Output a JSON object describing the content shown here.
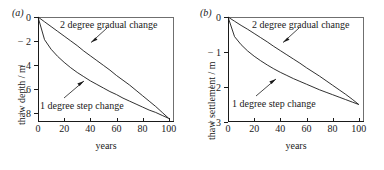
{
  "figure": {
    "panels": [
      {
        "label": "(a)",
        "xlabel": "years",
        "ylabel": "thaw depth / m",
        "xticks": [
          "0",
          "20",
          "40",
          "60",
          "80",
          "100"
        ],
        "yticks": [
          "0",
          "− 2",
          "− 4",
          "− 6",
          "− 8"
        ],
        "anno_gradual": "2 degree gradual change",
        "anno_step": "1 degree step change"
      },
      {
        "label": "(b)",
        "xlabel": "years",
        "ylabel": "thaw settlement / m",
        "xticks": [
          "0",
          "20",
          "40",
          "60",
          "80",
          "100"
        ],
        "yticks": [
          "0",
          "− 1",
          "− 2",
          "− 3"
        ],
        "anno_gradual": "2 degree gradual change",
        "anno_step": "1 degree step change"
      }
    ],
    "line_color": "#1a1a1a"
  },
  "chart_data": [
    {
      "type": "line",
      "title": "(a)",
      "xlabel": "years",
      "ylabel": "thaw depth / m",
      "xlim": [
        0,
        104
      ],
      "ylim": [
        -8.8,
        0
      ],
      "xticks": [
        0,
        20,
        40,
        60,
        80,
        100
      ],
      "yticks": [
        0,
        -2,
        -4,
        -6,
        -8
      ],
      "grid": false,
      "legend": "annotations-with-arrows",
      "x": [
        0,
        5,
        10,
        15,
        20,
        25,
        30,
        35,
        40,
        45,
        50,
        55,
        60,
        65,
        70,
        75,
        80,
        85,
        90,
        95,
        100
      ],
      "series": [
        {
          "name": "1 degree step change",
          "values": [
            0,
            -1.9,
            -2.7,
            -3.3,
            -3.8,
            -4.25,
            -4.65,
            -5.0,
            -5.35,
            -5.65,
            -5.95,
            -6.25,
            -6.5,
            -6.8,
            -7.05,
            -7.3,
            -7.55,
            -7.8,
            -8.0,
            -8.25,
            -8.5
          ]
        },
        {
          "name": "2 degree gradual change",
          "values": [
            0,
            -0.4,
            -0.8,
            -1.2,
            -1.6,
            -2.0,
            -2.4,
            -2.85,
            -3.25,
            -3.65,
            -4.05,
            -4.45,
            -4.9,
            -5.3,
            -5.7,
            -6.15,
            -6.6,
            -7.05,
            -7.5,
            -8.0,
            -8.5
          ]
        }
      ]
    },
    {
      "type": "line",
      "title": "(b)",
      "xlabel": "years",
      "ylabel": "thaw settlement / m",
      "xlim": [
        0,
        104
      ],
      "ylim": [
        -3,
        0
      ],
      "xticks": [
        0,
        20,
        40,
        60,
        80,
        100
      ],
      "yticks": [
        0,
        -1,
        -2,
        -3
      ],
      "grid": false,
      "legend": "annotations-with-arrows",
      "x": [
        0,
        5,
        10,
        15,
        20,
        25,
        30,
        35,
        40,
        45,
        50,
        55,
        60,
        65,
        70,
        75,
        80,
        85,
        90,
        95,
        100
      ],
      "series": [
        {
          "name": "1 degree step change",
          "values": [
            0,
            -0.56,
            -0.79,
            -0.97,
            -1.12,
            -1.25,
            -1.37,
            -1.48,
            -1.58,
            -1.67,
            -1.76,
            -1.84,
            -1.92,
            -2.0,
            -2.08,
            -2.15,
            -2.22,
            -2.29,
            -2.36,
            -2.43,
            -2.5
          ]
        },
        {
          "name": "2 degree gradual change",
          "values": [
            0,
            -0.12,
            -0.24,
            -0.35,
            -0.47,
            -0.59,
            -0.71,
            -0.84,
            -0.96,
            -1.08,
            -1.2,
            -1.32,
            -1.45,
            -1.57,
            -1.69,
            -1.82,
            -1.95,
            -2.08,
            -2.21,
            -2.35,
            -2.5
          ]
        }
      ]
    }
  ]
}
